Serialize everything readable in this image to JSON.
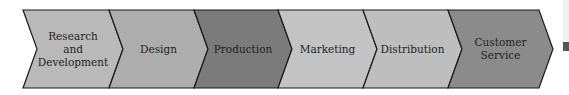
{
  "diagram": {
    "type": "chevron-process",
    "stages": [
      {
        "lines": [
          "Research",
          "and",
          "Development"
        ],
        "color": "#b9b9b9"
      },
      {
        "lines": [
          "Design"
        ],
        "color": "#adadad"
      },
      {
        "lines": [
          "Production"
        ],
        "color": "#7b7b7b"
      },
      {
        "lines": [
          "Marketing"
        ],
        "color": "#c3c3c3"
      },
      {
        "lines": [
          "Distribution"
        ],
        "color": "#bebebe"
      },
      {
        "lines": [
          "Customer",
          "Service"
        ],
        "color": "#8b8b8b"
      }
    ],
    "outline_color": "#1a1a1a"
  }
}
